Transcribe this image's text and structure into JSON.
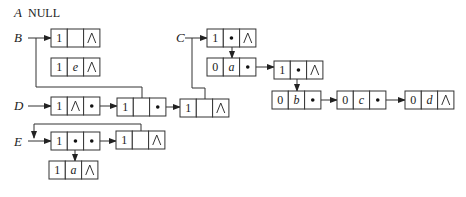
{
  "heads": [
    {
      "name": "A",
      "value": "NULL",
      "x": 14,
      "y": 17
    },
    {
      "name": "B",
      "x": 14,
      "y": 42
    },
    {
      "name": "C",
      "x": 176,
      "y": 42
    },
    {
      "name": "D",
      "x": 14,
      "y": 110
    },
    {
      "name": "E",
      "x": 14,
      "y": 146
    }
  ],
  "nodes": [
    {
      "id": "B1",
      "x": 51,
      "y": 29,
      "cells": [
        "1",
        "",
        "∧"
      ]
    },
    {
      "id": "B2",
      "x": 51,
      "y": 58,
      "cells": [
        "1",
        "e",
        "∧"
      ]
    },
    {
      "id": "C1",
      "x": 207,
      "y": 29,
      "cells": [
        "1",
        "•",
        "∧"
      ]
    },
    {
      "id": "C2",
      "x": 207,
      "y": 58,
      "cells": [
        "0",
        "a",
        "•"
      ]
    },
    {
      "id": "C3",
      "x": 274,
      "y": 61,
      "cells": [
        "1",
        "•",
        "∧"
      ]
    },
    {
      "id": "C4",
      "x": 272,
      "y": 91,
      "cells": [
        "0",
        "b",
        "•"
      ]
    },
    {
      "id": "C5",
      "x": 337,
      "y": 91,
      "cells": [
        "0",
        "c",
        "•"
      ]
    },
    {
      "id": "C6",
      "x": 405,
      "y": 91,
      "cells": [
        "0",
        "d",
        "∧"
      ]
    },
    {
      "id": "D1",
      "x": 51,
      "y": 97,
      "cells": [
        "1",
        "∧",
        "•"
      ]
    },
    {
      "id": "D2",
      "x": 117,
      "y": 98,
      "cells": [
        "1",
        "",
        "•"
      ]
    },
    {
      "id": "D3",
      "x": 180,
      "y": 99,
      "cells": [
        "1",
        "",
        "∧"
      ]
    },
    {
      "id": "E1",
      "x": 51,
      "y": 132,
      "cells": [
        "1",
        "•",
        "•"
      ]
    },
    {
      "id": "E2",
      "x": 116,
      "y": 131,
      "cells": [
        "1",
        "",
        "∧"
      ]
    },
    {
      "id": "E3",
      "x": 49,
      "y": 161,
      "cells": [
        "1",
        "a",
        "∧"
      ]
    }
  ],
  "cell_width": 16.3,
  "cell_height": 18,
  "italic_values": [
    "a",
    "b",
    "c",
    "d",
    "e"
  ],
  "edges": [
    {
      "from": "B-label",
      "points": [
        [
          28,
          38
        ],
        [
          51,
          38
        ]
      ],
      "arrow": true
    },
    {
      "from": "B-down",
      "points": [
        [
          36,
          38
        ],
        [
          36,
          87
        ],
        [
          142,
          87
        ],
        [
          142,
          98
        ]
      ],
      "arrow": false
    },
    {
      "from": "C-label",
      "points": [
        [
          185,
          38
        ],
        [
          207,
          38
        ]
      ],
      "arrow": true
    },
    {
      "from": "C-down",
      "points": [
        [
          192,
          38
        ],
        [
          192,
          88
        ],
        [
          205,
          88
        ],
        [
          205,
          99
        ]
      ],
      "arrow": false
    },
    {
      "from": "C1-mid",
      "points": [
        [
          232,
          38
        ],
        [
          232,
          58
        ]
      ],
      "arrow": true
    },
    {
      "from": "C2-next",
      "points": [
        [
          248,
          67
        ],
        [
          274,
          67
        ]
      ],
      "arrow": true
    },
    {
      "from": "C3-mid",
      "points": [
        [
          297,
          70
        ],
        [
          297,
          91
        ]
      ],
      "arrow": true
    },
    {
      "from": "C4-next",
      "points": [
        [
          310,
          100
        ],
        [
          337,
          100
        ]
      ],
      "arrow": true
    },
    {
      "from": "C5-next",
      "points": [
        [
          377,
          100
        ],
        [
          405,
          100
        ]
      ],
      "arrow": true
    },
    {
      "from": "D-label",
      "points": [
        [
          28,
          106
        ],
        [
          51,
          106
        ]
      ],
      "arrow": true
    },
    {
      "from": "D1-next",
      "points": [
        [
          92,
          106
        ],
        [
          117,
          106
        ]
      ],
      "arrow": true
    },
    {
      "from": "D2-next",
      "points": [
        [
          158,
          107
        ],
        [
          180,
          107
        ]
      ],
      "arrow": true
    },
    {
      "from": "E-label",
      "points": [
        [
          28,
          141
        ],
        [
          51,
          141
        ]
      ],
      "arrow": true
    },
    {
      "from": "E1-next",
      "points": [
        [
          91,
          141
        ],
        [
          116,
          141
        ]
      ],
      "arrow": true
    },
    {
      "from": "E1-mid",
      "points": [
        [
          75,
          141
        ],
        [
          75,
          161
        ]
      ],
      "arrow": true
    },
    {
      "from": "E2-loop",
      "points": [
        [
          141,
          140
        ],
        [
          141,
          124
        ],
        [
          34,
          124
        ],
        [
          34,
          138
        ]
      ],
      "arrow": true
    }
  ]
}
